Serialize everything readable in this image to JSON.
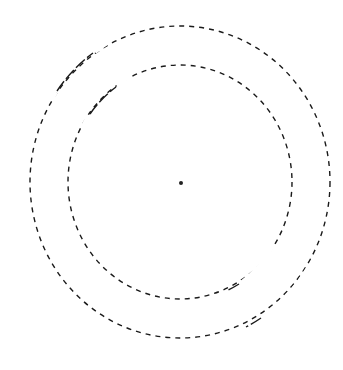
{
  "diagram": {
    "type": "concentric-dashed-circles",
    "background": "#ffffff",
    "stroke_color": "#1a1a1a",
    "center": {
      "x": 180,
      "y": 182
    },
    "center_dot": {
      "x": 181,
      "y": 183,
      "r": 2
    },
    "rings": [
      {
        "name": "outer",
        "rx": 150,
        "ry": 156
      },
      {
        "name": "inner",
        "rx": 112,
        "ry": 117
      }
    ]
  }
}
